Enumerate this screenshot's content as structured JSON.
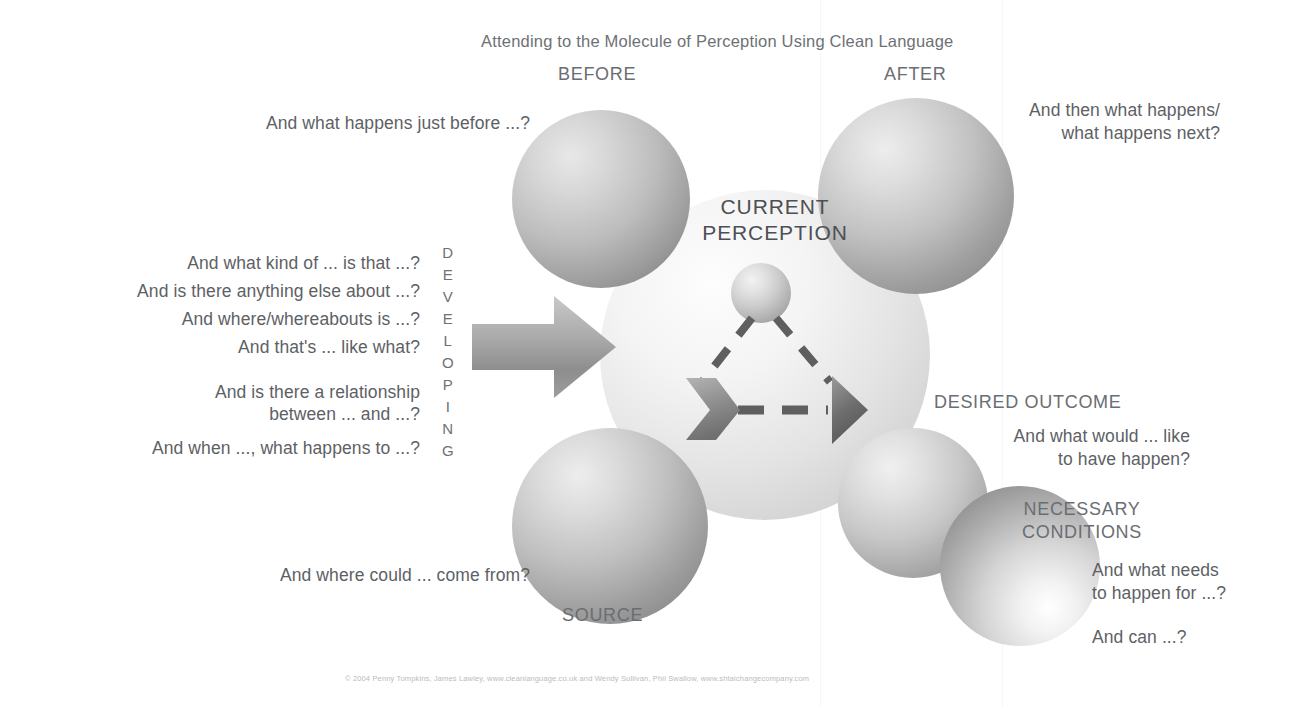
{
  "title": "Attending to the Molecule of Perception Using Clean Language",
  "center": {
    "line1": "CURRENT",
    "line2": "PERCEPTION"
  },
  "nodes": {
    "before": "BEFORE",
    "after": "AFTER",
    "source": "SOURCE",
    "desired_outcome": "DESIRED OUTCOME",
    "necessary_conditions_line1": "NECESSARY",
    "necessary_conditions_line2": "CONDITIONS"
  },
  "axis": {
    "developing": "DEVELOPING",
    "letters": [
      "D",
      "E",
      "V",
      "E",
      "L",
      "O",
      "P",
      "I",
      "N",
      "G"
    ]
  },
  "questions": {
    "before": "And what happens just before ...?",
    "after_line1": "And then what happens/",
    "after_line2": "what happens next?",
    "source": "And where could ... come from?",
    "desired_line1": "And what would ... like",
    "desired_line2": "to have happen?",
    "necessary_line1": "And what needs",
    "necessary_line2": "to happen for ...?",
    "necessary_line3": "And can ...?",
    "developing": [
      {
        "line1": "And what kind of ... is that ...?"
      },
      {
        "line1": "And is there anything else about ...?"
      },
      {
        "line1": "And where/whereabouts is ...?"
      },
      {
        "line1": "And that's ... like what?"
      },
      {
        "line1": "And is there a relationship",
        "line2": "between ... and ...?"
      },
      {
        "line1": "And when ..., what happens to ...?"
      }
    ]
  },
  "footer": "© 2004 Penny Tompkins, James Lawley, www.cleanlanguage.co.uk and Wendy Sullivan, Phil Swallow, www.shtaichangecompany.com",
  "colors": {
    "text": "#5d6165",
    "label": "#6a6e72",
    "background": "#ffffff",
    "arrow": "#9a9a9a",
    "dash": "#5a5a5a"
  }
}
